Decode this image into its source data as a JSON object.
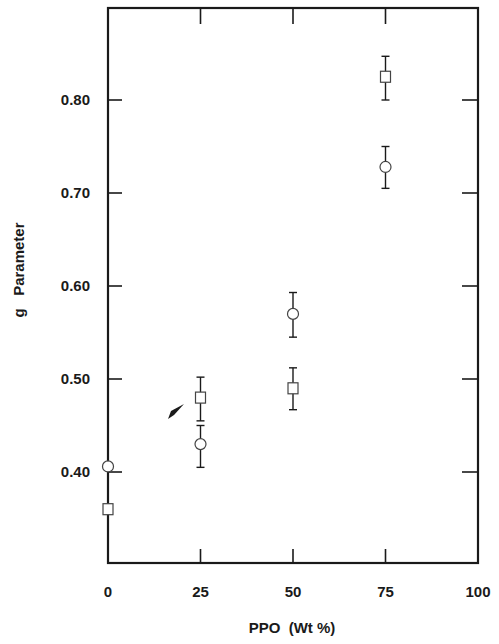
{
  "chart_data": {
    "type": "scatter",
    "title": "",
    "xlabel": "PPO  (Wt %)",
    "ylabel": "g   Parameter",
    "xlim": [
      0,
      100
    ],
    "ylim": [
      0.317,
      0.915
    ],
    "xticks": [
      0,
      25,
      50,
      75,
      100
    ],
    "xtick_labels": [
      "0",
      "25",
      "50",
      "75",
      "100"
    ],
    "yticks": [
      0.4,
      0.5,
      0.6,
      0.7,
      0.8
    ],
    "ytick_labels": [
      "0.40",
      "0.50",
      "0.60",
      "0.70",
      "0.80"
    ],
    "grid": false,
    "legend": null,
    "frame": "box with ticks on all four sides",
    "series": [
      {
        "name": "circles",
        "marker": "open-circle",
        "x": [
          0,
          25,
          50,
          75
        ],
        "y": [
          0.406,
          0.43,
          0.57,
          0.728
        ],
        "yerr_low": [
          null,
          0.405,
          0.545,
          0.705
        ],
        "yerr_high": [
          null,
          0.45,
          0.593,
          0.75
        ]
      },
      {
        "name": "squares",
        "marker": "open-square",
        "x": [
          0,
          25,
          50,
          75
        ],
        "y": [
          0.36,
          0.48,
          0.49,
          0.825
        ],
        "yerr_low": [
          null,
          0.455,
          0.467,
          0.8
        ],
        "yerr_high": [
          null,
          0.502,
          0.512,
          0.847
        ]
      }
    ],
    "annotations": [
      {
        "type": "arrow",
        "pointing_to": "square at x=25",
        "x": 20,
        "y": 0.47
      }
    ]
  },
  "colors": {
    "ink": "#1a1a1a",
    "background": "#ffffff"
  }
}
